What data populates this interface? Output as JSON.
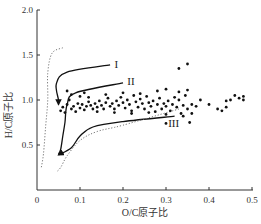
{
  "chart_data": {
    "type": "scatter",
    "title": "",
    "xlabel": "O/C原子比",
    "ylabel": "H/C原子比",
    "xlim": [
      0,
      0.5
    ],
    "ylim": [
      0,
      2.0
    ],
    "xticks": [
      "0",
      "0.1",
      "0.2",
      "0.3",
      "0.4",
      "0.5"
    ],
    "xtick_values": [
      0,
      0.1,
      0.2,
      0.3,
      0.4,
      0.5
    ],
    "yticks": [
      "0.5",
      "1.0",
      "1.5",
      "2.0"
    ],
    "ytick_values": [
      0.5,
      1.0,
      1.5,
      2.0
    ],
    "grid": false,
    "legend": null,
    "annotations": [
      {
        "text": "I",
        "x": 0.18,
        "y": 1.4
      },
      {
        "text": "II",
        "x": 0.21,
        "y": 1.21
      },
      {
        "text": "III",
        "x": 0.305,
        "y": 0.75
      }
    ],
    "curves": [
      {
        "name": "I",
        "style": "solid-arrow",
        "points": [
          [
            0.17,
            1.39
          ],
          [
            0.07,
            1.31
          ],
          [
            0.045,
            1.18
          ],
          [
            0.05,
            1.0
          ],
          [
            0.05,
            0.95
          ]
        ]
      },
      {
        "name": "II",
        "style": "solid",
        "points": [
          [
            0.2,
            1.19
          ],
          [
            0.09,
            1.08
          ],
          [
            0.07,
            0.95
          ],
          [
            0.065,
            0.75
          ],
          [
            0.06,
            0.6
          ],
          [
            0.055,
            0.45
          ],
          [
            0.05,
            0.4
          ]
        ]
      },
      {
        "name": "III",
        "style": "solid-arrow",
        "points": [
          [
            0.32,
            0.82
          ],
          [
            0.2,
            0.76
          ],
          [
            0.13,
            0.7
          ],
          [
            0.1,
            0.6
          ],
          [
            0.08,
            0.47
          ],
          [
            0.05,
            0.39
          ]
        ]
      },
      {
        "name": "boundary-upper",
        "style": "dotted",
        "points": [
          [
            0.06,
            1.58
          ],
          [
            0.035,
            1.52
          ],
          [
            0.025,
            1.3
          ],
          [
            0.025,
            1.0
          ],
          [
            0.02,
            0.7
          ],
          [
            0.015,
            0.4
          ],
          [
            0.01,
            0.25
          ]
        ]
      },
      {
        "name": "boundary-lower",
        "style": "dotted",
        "points": [
          [
            0.33,
            0.9
          ],
          [
            0.2,
            0.72
          ],
          [
            0.14,
            0.65
          ],
          [
            0.1,
            0.55
          ],
          [
            0.07,
            0.38
          ],
          [
            0.055,
            0.25
          ],
          [
            0.045,
            0.2
          ]
        ]
      }
    ],
    "series": [
      {
        "name": "samples",
        "points": [
          [
            0.055,
            0.88
          ],
          [
            0.06,
            0.92
          ],
          [
            0.065,
            0.86
          ],
          [
            0.07,
            0.95
          ],
          [
            0.075,
            1.0
          ],
          [
            0.08,
            0.9
          ],
          [
            0.085,
            0.93
          ],
          [
            0.09,
            0.87
          ],
          [
            0.095,
            0.96
          ],
          [
            0.1,
            0.91
          ],
          [
            0.105,
            0.95
          ],
          [
            0.11,
            0.89
          ],
          [
            0.115,
            0.93
          ],
          [
            0.12,
            0.98
          ],
          [
            0.125,
            0.94
          ],
          [
            0.13,
            0.9
          ],
          [
            0.135,
            0.96
          ],
          [
            0.14,
            0.92
          ],
          [
            0.145,
            0.99
          ],
          [
            0.15,
            0.94
          ],
          [
            0.155,
            0.9
          ],
          [
            0.16,
            0.97
          ],
          [
            0.165,
            1.02
          ],
          [
            0.17,
            0.93
          ],
          [
            0.175,
            0.96
          ],
          [
            0.18,
            0.9
          ],
          [
            0.185,
            0.99
          ],
          [
            0.19,
            0.94
          ],
          [
            0.195,
            1.03
          ],
          [
            0.2,
            0.97
          ],
          [
            0.205,
            0.91
          ],
          [
            0.21,
            1.0
          ],
          [
            0.215,
            0.95
          ],
          [
            0.22,
            0.88
          ],
          [
            0.225,
            1.05
          ],
          [
            0.23,
            0.98
          ],
          [
            0.235,
            0.92
          ],
          [
            0.24,
            1.01
          ],
          [
            0.245,
            0.96
          ],
          [
            0.25,
            0.9
          ],
          [
            0.255,
            1.04
          ],
          [
            0.26,
            0.97
          ],
          [
            0.265,
            0.93
          ],
          [
            0.27,
            0.99
          ],
          [
            0.275,
            0.87
          ],
          [
            0.28,
            0.95
          ],
          [
            0.285,
            1.02
          ],
          [
            0.29,
            0.9
          ],
          [
            0.295,
            0.96
          ],
          [
            0.3,
            0.93
          ],
          [
            0.305,
            0.99
          ],
          [
            0.31,
            0.88
          ],
          [
            0.315,
            0.95
          ],
          [
            0.32,
            1.03
          ],
          [
            0.325,
            0.92
          ],
          [
            0.33,
            1.0
          ],
          [
            0.335,
            0.85
          ],
          [
            0.34,
            0.94
          ],
          [
            0.345,
            1.05
          ],
          [
            0.35,
            0.9
          ],
          [
            0.12,
            1.03
          ],
          [
            0.16,
            1.06
          ],
          [
            0.2,
            1.08
          ],
          [
            0.24,
            1.07
          ],
          [
            0.28,
            1.1
          ],
          [
            0.3,
            1.12
          ],
          [
            0.33,
            1.09
          ],
          [
            0.35,
            1.11
          ],
          [
            0.14,
            0.87
          ],
          [
            0.18,
            0.86
          ],
          [
            0.22,
            0.85
          ],
          [
            0.26,
            0.86
          ],
          [
            0.3,
            0.84
          ],
          [
            0.34,
            0.82
          ],
          [
            0.08,
            1.06
          ],
          [
            0.1,
            1.04
          ],
          [
            0.07,
            1.1
          ],
          [
            0.11,
            1.08
          ],
          [
            0.33,
            1.35
          ],
          [
            0.35,
            1.4
          ],
          [
            0.355,
            0.75
          ],
          [
            0.3,
            0.74
          ],
          [
            0.37,
            0.93
          ],
          [
            0.38,
            1.0
          ],
          [
            0.4,
            0.95
          ],
          [
            0.42,
            0.9
          ],
          [
            0.43,
            0.88
          ],
          [
            0.44,
            0.99
          ],
          [
            0.45,
            1.0
          ],
          [
            0.46,
            1.05
          ],
          [
            0.47,
            1.02
          ],
          [
            0.48,
            1.0
          ],
          [
            0.48,
            1.04
          ],
          [
            0.44,
            0.92
          ],
          [
            0.36,
            0.85
          ],
          [
            0.36,
            0.95
          ]
        ]
      }
    ]
  }
}
